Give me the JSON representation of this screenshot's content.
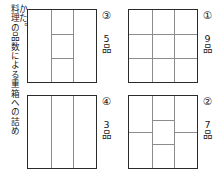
{
  "caption": {
    "line_main": "料理の品数による重箱への詰め",
    "line_tail": "かた。"
  },
  "boxes": [
    {
      "id": "box-3",
      "position": "top-left",
      "number_label": "③",
      "count_label": "5品",
      "compartments": 5,
      "vertical_lines_pct": [
        33.3,
        66.6
      ],
      "horizontal_segments": [
        {
          "column": "middle",
          "y_pct": 33.3
        },
        {
          "column": "middle",
          "y_pct": 66.6
        }
      ]
    },
    {
      "id": "box-1",
      "position": "top-right",
      "number_label": "①",
      "count_label": "9品",
      "compartments": 9,
      "vertical_lines_pct": [
        33.3,
        66.6
      ],
      "horizontal_segments": [
        {
          "column": "full",
          "y_pct": 33.3
        },
        {
          "column": "full",
          "y_pct": 66.6
        }
      ]
    },
    {
      "id": "box-4",
      "position": "bottom-left",
      "number_label": "④",
      "count_label": "3品",
      "compartments": 3,
      "vertical_lines_pct": [
        33.3,
        66.6
      ],
      "horizontal_segments": []
    },
    {
      "id": "box-2",
      "position": "bottom-right",
      "number_label": "②",
      "count_label": "7品",
      "compartments": 7,
      "vertical_lines_pct": [
        33.3,
        66.6
      ],
      "horizontal_segments": [
        {
          "column": "left",
          "y_pct": 50.0
        },
        {
          "column": "middle",
          "y_pct": 33.3
        },
        {
          "column": "middle",
          "y_pct": 66.6
        },
        {
          "column": "right",
          "y_pct": 50.0
        }
      ]
    }
  ],
  "colors": {
    "border": "#2b2b2b",
    "inner_line": "#8c8c8c",
    "text": "#171717",
    "background": "#ffffff"
  }
}
